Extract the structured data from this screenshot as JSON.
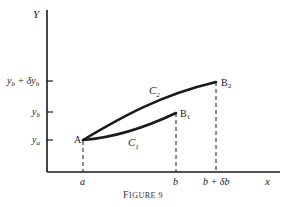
{
  "figure": {
    "caption": "Figure 9",
    "caption_first": "F",
    "caption_rest": "IGURE 9",
    "axes": {
      "y_label": "Y",
      "x_label": "x"
    },
    "y_ticks": [
      {
        "label_main": "y",
        "label_sub": "b",
        "label_extra": " + δy",
        "label_extra_sub": "b",
        "full": "y_b + δy_b"
      },
      {
        "label_main": "y",
        "label_sub": "b",
        "full": "y_b"
      },
      {
        "label_main": "y",
        "label_sub": "a",
        "full": "y_a"
      }
    ],
    "x_ticks": [
      {
        "label": "a"
      },
      {
        "label": "b"
      },
      {
        "label": "b + δb"
      }
    ],
    "points": {
      "A": {
        "label": "A"
      },
      "B1": {
        "label": "B",
        "sub": "1"
      },
      "B2": {
        "label": "B",
        "sub": "2"
      }
    },
    "curves": {
      "C1": {
        "label": "C",
        "sub": "1"
      },
      "C2": {
        "label": "C",
        "sub": "2"
      }
    },
    "colors": {
      "ink": "#1a1a1a",
      "background": "#ffffff"
    }
  }
}
